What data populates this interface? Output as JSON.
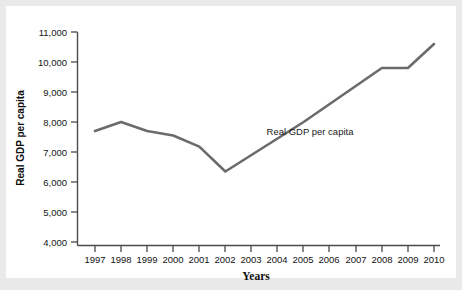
{
  "chart_data": {
    "type": "line",
    "title": "",
    "xlabel": "Years",
    "ylabel": "Real GDP per capita",
    "grid": false,
    "legend_position": "inline-annotation",
    "annotations": [
      "Real GDP per capita"
    ],
    "x": [
      1997,
      1998,
      1999,
      2000,
      2001,
      2002,
      2003,
      2004,
      2005,
      2006,
      2007,
      2008,
      2009,
      2010
    ],
    "categories": [
      "1997",
      "1998",
      "1999",
      "2000",
      "2001",
      "2002",
      "2003",
      "2004",
      "2005",
      "2006",
      "2007",
      "2008",
      "2009",
      "2010"
    ],
    "values": [
      7700,
      8000,
      7700,
      7550,
      7180,
      6350,
      6900,
      7450,
      8000,
      8600,
      9200,
      9800,
      9800,
      10600
    ],
    "series": [
      {
        "name": "Real GDP per capita",
        "color": "#6b6b6b",
        "values": [
          7700,
          8000,
          7700,
          7550,
          7180,
          6350,
          6900,
          7450,
          8000,
          8600,
          9200,
          9800,
          9800,
          10600
        ]
      }
    ],
    "xlim": [
      1997,
      2010
    ],
    "ylim": [
      4000,
      11000
    ],
    "ytick_labels": [
      "11,000",
      "10,000",
      "9,000",
      "8,000",
      "7,000",
      "6,000",
      "5,000",
      "4,000"
    ],
    "ytick_values": [
      11000,
      10000,
      9000,
      8000,
      7000,
      6000,
      5000,
      4000
    ],
    "xtick_labels": [
      "1997",
      "1998",
      "1999",
      "2000",
      "2001",
      "2002",
      "2003",
      "2004",
      "2005",
      "2006",
      "2007",
      "2008",
      "2009",
      "2010"
    ]
  },
  "axis": {
    "y_title": "Real GDP per capita",
    "x_title": "Years"
  },
  "colors": {
    "line": "#6b6b6b",
    "axis": "#4a4a4a",
    "text": "#141414",
    "page_background": "#e9e9e9",
    "plot_background": "#ffffff"
  }
}
